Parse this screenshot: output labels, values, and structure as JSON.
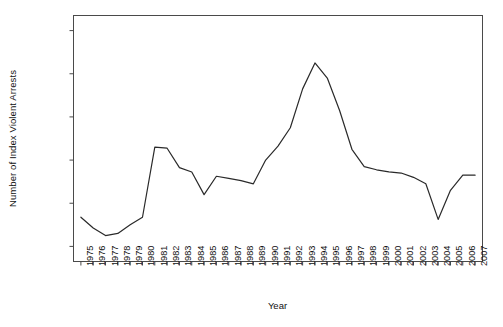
{
  "chart_data": {
    "type": "line",
    "title": "",
    "xlabel": "Year",
    "ylabel": "Number of Index Violent Arrests",
    "xlim": [
      1974.4,
      2007.6
    ],
    "ylim": [
      33000,
      147000
    ],
    "grid": false,
    "legend": null,
    "yticks": [
      40000,
      60000,
      80000,
      100000,
      120000,
      140000
    ],
    "ytick_labels": [
      "40000",
      "60000",
      "80000",
      "100000",
      "120000",
      "140000"
    ],
    "categories": [
      "1975",
      "1976",
      "1977",
      "1978",
      "1979",
      "1980",
      "1981",
      "1982",
      "1983",
      "1984",
      "1985",
      "1986",
      "1987",
      "1988",
      "1989",
      "1990",
      "1991",
      "1992",
      "1993",
      "1994",
      "1995",
      "1996",
      "1997",
      "1998",
      "1999",
      "2000",
      "2001",
      "2002",
      "2003",
      "2004",
      "2005",
      "2006",
      "2007"
    ],
    "x": [
      1975,
      1976,
      1977,
      1978,
      1979,
      1980,
      1981,
      1982,
      1983,
      1984,
      1985,
      1986,
      1987,
      1988,
      1989,
      1990,
      1991,
      1992,
      1993,
      1994,
      1995,
      1996,
      1997,
      1998,
      1999,
      2000,
      2001,
      2002,
      2003,
      2004,
      2005,
      2006,
      2007
    ],
    "values": [
      53500,
      48500,
      45000,
      46000,
      50000,
      53500,
      86000,
      85500,
      76500,
      74500,
      64000,
      72500,
      71500,
      70500,
      69000,
      80000,
      86500,
      95000,
      113000,
      125000,
      118000,
      103000,
      85000,
      77000,
      75500,
      74500,
      74000,
      72000,
      69000,
      52500,
      66000,
      73000,
      73000
    ],
    "series": [
      {
        "name": "Index Violent Arrests",
        "color": "#2a2a2a",
        "values": [
          53500,
          48500,
          45000,
          46000,
          50000,
          53500,
          86000,
          85500,
          76500,
          74500,
          64000,
          72500,
          71500,
          70500,
          69000,
          80000,
          86500,
          95000,
          113000,
          125000,
          118000,
          103000,
          85000,
          77000,
          75500,
          74500,
          74000,
          72000,
          69000,
          52500,
          66000,
          73000,
          73000
        ]
      }
    ]
  },
  "figure": {
    "caption": ""
  }
}
